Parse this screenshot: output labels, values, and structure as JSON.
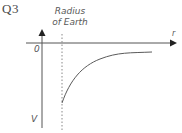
{
  "question": {
    "label": "Q3"
  },
  "diagram": {
    "annotation": {
      "line1": "Radius",
      "line2": "of Earth"
    },
    "axes": {
      "x_label": "r",
      "y_label": "V",
      "origin_label": "0"
    },
    "curve": {
      "description": "Gravitational potential V vs distance r, starting at radius of Earth with negative value, increasing asymptotically toward 0"
    },
    "colors": {
      "axis": "#555555",
      "curve": "#5a5a5a",
      "dashed_line": "#888888",
      "text": "#555555"
    }
  }
}
